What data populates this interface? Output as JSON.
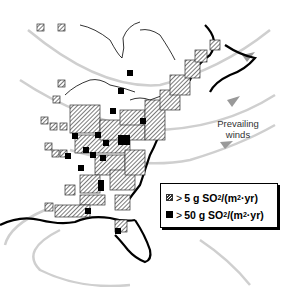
{
  "map": {
    "region": "Eastern United States",
    "annotations": {
      "winds_label_line1": "Prevailing",
      "winds_label_line2": "winds"
    },
    "legend": {
      "items": [
        {
          "symbol": "hatched-square",
          "prefix": ">",
          "value": "5 g SO",
          "sub": "2",
          "unit_pre": "/(m",
          "sup": "2",
          "unit_post": "·yr)"
        },
        {
          "symbol": "solid-square",
          "prefix": ">",
          "value": "50 g SO",
          "sub": "2",
          "unit_pre": "/(m",
          "sup": "2",
          "unit_post": "·yr)"
        }
      ]
    },
    "colors": {
      "wind_arrows": "#c8c8c8",
      "coast": "#000000",
      "hatch": "#333333",
      "high_emission": "#000000"
    }
  }
}
